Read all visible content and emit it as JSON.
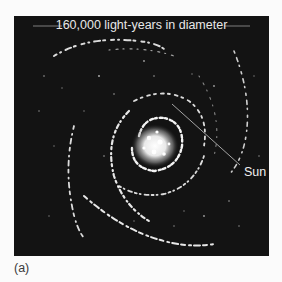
{
  "figure": {
    "title": "160,000 light-years in diameter",
    "annotation": "Sun",
    "caption": "(a)",
    "colors": {
      "panel_background": "#131313",
      "stars": "#ffffff",
      "text": "#e8e8e8",
      "page_background": "#fbfbfb"
    }
  }
}
